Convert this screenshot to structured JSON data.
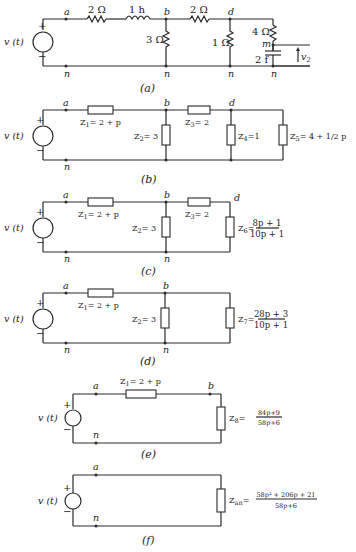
{
  "source": {
    "label": "v (t)",
    "plus": "+",
    "minus": "−"
  },
  "circuit_a": {
    "caption": "(a)",
    "nodes": {
      "a": "a",
      "b": "b",
      "d": "d",
      "m": "m",
      "n": "n"
    },
    "elements": {
      "r1": "2 Ω",
      "l1": "1 h",
      "r_shunt_b": "3 Ω",
      "r2": "2 Ω",
      "r_shunt_d": "1 Ω",
      "r_series_m": "4 Ω",
      "c1": "2 f"
    },
    "output_voltage": "v",
    "output_voltage_sub": "2"
  },
  "circuit_b": {
    "caption": "(b)",
    "nodes": {
      "a": "a",
      "b": "b",
      "d": "d",
      "n": "n"
    },
    "z1": {
      "sym": "Z",
      "sub": "1",
      "val": "= 2 + p"
    },
    "z2": {
      "sym": "Z",
      "sub": "2",
      "val": "= 3"
    },
    "z3": {
      "sym": "Z",
      "sub": "3",
      "val": "= 2"
    },
    "z4": {
      "sym": "Z",
      "sub": "4",
      "val": "=1"
    },
    "z5": {
      "sym": "Z",
      "sub": "5",
      "val": "= 4 + 1/2 p"
    }
  },
  "circuit_c": {
    "caption": "(c)",
    "nodes": {
      "a": "a",
      "b": "b",
      "d": "d",
      "n": "n"
    },
    "z1": {
      "sym": "Z",
      "sub": "1",
      "val": "= 2 + p"
    },
    "z2": {
      "sym": "Z",
      "sub": "2",
      "val": "= 3"
    },
    "z3": {
      "sym": "Z",
      "sub": "3",
      "val": "= 2"
    },
    "z6": {
      "sym": "Z",
      "sub": "6",
      "eq": "=",
      "num": "8p + 1",
      "den": "10p + 1"
    }
  },
  "circuit_d": {
    "caption": "(d)",
    "nodes": {
      "a": "a",
      "b": "b",
      "n": "n"
    },
    "z1": {
      "sym": "Z",
      "sub": "1",
      "val": "= 2 + p"
    },
    "z2": {
      "sym": "Z",
      "sub": "2",
      "val": "= 3"
    },
    "z7": {
      "sym": "Z",
      "sub": "7",
      "eq": "=",
      "num": "28p + 3",
      "den": "10p + 1"
    }
  },
  "circuit_e": {
    "caption": "(e)",
    "nodes": {
      "a": "a",
      "b": "b",
      "n": "n"
    },
    "z1": {
      "sym": "Z",
      "sub": "1",
      "val": "= 2 + p"
    },
    "z8": {
      "sym": "Z",
      "sub": "8",
      "eq": "=",
      "num": "84p+9",
      "den": "58p+6"
    }
  },
  "circuit_f": {
    "caption": "(f)",
    "nodes": {
      "a": "a",
      "n": "n"
    },
    "zan": {
      "sym": "Z",
      "sub": "an",
      "eq": "=",
      "num": "58p² + 206p + 21",
      "den": "58p+6"
    }
  }
}
